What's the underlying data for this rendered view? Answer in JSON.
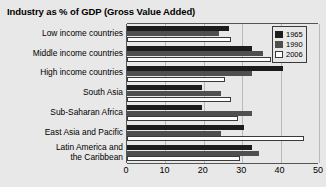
{
  "chart_data": {
    "type": "bar",
    "orientation": "horizontal",
    "title": "Industry as % of GDP (Gross Value Added)",
    "xlabel": "",
    "ylabel": "",
    "xlim": [
      0,
      50
    ],
    "xticks": [
      0,
      10,
      20,
      30,
      40,
      50
    ],
    "xtick_labels": [
      "0",
      "10",
      "20",
      "30",
      "40",
      "50"
    ],
    "grid": true,
    "grid_axis": "x",
    "legend_position": "top-right",
    "categories": [
      "Low income countries",
      "Middle income countries",
      "High income countries",
      "South Asia",
      "Sub-Saharan Africa",
      "East Asia and Pacific",
      "Latin America and\nthe Caribbean"
    ],
    "series": [
      {
        "name": "1965",
        "color": "#1c1c1c",
        "values": [
          26.5,
          32.5,
          40.5,
          19.5,
          19.5,
          30.5,
          32.5
        ]
      },
      {
        "name": "1990",
        "color": "#4f4f4f",
        "values": [
          24.0,
          35.5,
          32.5,
          24.5,
          32.5,
          24.5,
          34.5
        ]
      },
      {
        "name": "2006",
        "color": "#ffffff",
        "values": [
          27.0,
          37.5,
          25.5,
          27.0,
          29.0,
          46.0,
          29.5
        ]
      }
    ]
  },
  "legend": {
    "items": [
      {
        "label": "1965"
      },
      {
        "label": "1990"
      },
      {
        "label": "2006"
      }
    ]
  }
}
